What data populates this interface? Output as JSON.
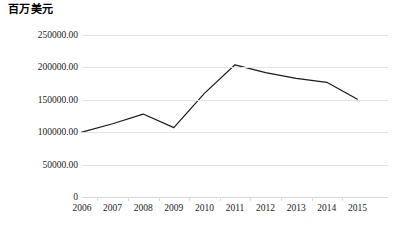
{
  "chart_data": {
    "type": "line",
    "title": "百万美元",
    "xlabel": "",
    "ylabel": "",
    "categories": [
      "2006",
      "2007",
      "2008",
      "2009",
      "2010",
      "2011",
      "2012",
      "2013",
      "2014",
      "2015"
    ],
    "values": [
      100000,
      113000,
      128000,
      107000,
      160000,
      204000,
      192000,
      183000,
      177000,
      151000
    ],
    "ylim": [
      0,
      250000
    ],
    "yticks": [
      0,
      50000,
      100000,
      150000,
      200000,
      250000
    ],
    "ytick_labels": [
      "0",
      "50000.00",
      "100000.00",
      "150000.00",
      "200000.00",
      "250000.00"
    ],
    "grid": true,
    "legend": false,
    "series": [
      {
        "name": "百万美元",
        "color": "#1a1a1a",
        "values": [
          100000,
          113000,
          128000,
          107000,
          160000,
          204000,
          192000,
          183000,
          177000,
          151000
        ]
      }
    ],
    "line_color": "#1a1a1a",
    "grid_color": "#e2e2e2"
  }
}
